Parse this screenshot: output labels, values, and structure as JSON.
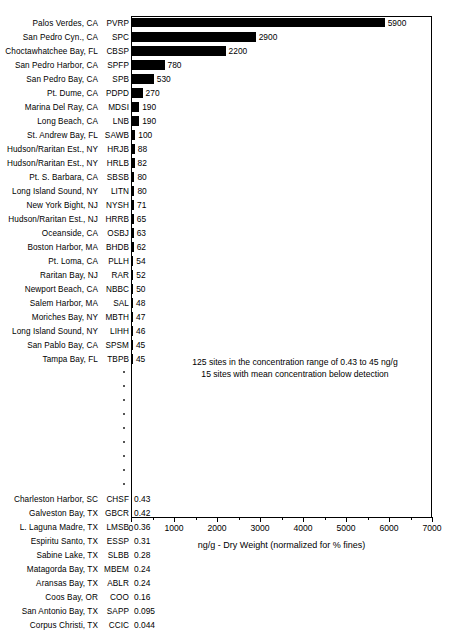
{
  "chart_data": {
    "type": "bar",
    "orientation": "horizontal",
    "title": "",
    "xlabel": "ng/g - Dry Weight (normalized for % fines)",
    "ylabel": "",
    "xlim": [
      0,
      7000
    ],
    "xticks": [
      0,
      1000,
      2000,
      3000,
      4000,
      5000,
      6000,
      7000
    ],
    "xtick_labels": [
      "0",
      "1000",
      "2000",
      "3000",
      "4000",
      "5000",
      "6000",
      "7000"
    ],
    "minor_tick_interval": 500,
    "grid": false,
    "legend": "none",
    "bar_color": "#000000",
    "categories": [
      "Palos Verdes, CA",
      "San Pedro Cyn., CA",
      "Choctawhatchee Bay, FL",
      "San Pedro Harbor, CA",
      "San Pedro Bay, CA",
      "Pt. Dume, CA",
      "Marina Del Ray, CA",
      "Long Beach, CA",
      "St. Andrew Bay, FL",
      "Hudson/Raritan Est., NY",
      "Hudson/Raritan Est., NY",
      "Pt. S. Barbara, CA",
      "Long Island Sound, NY",
      "New York Bight, NJ",
      "Hudson/Raritan Est., NJ",
      "Oceanside, CA",
      "Boston Harbor, MA",
      "Pt. Loma, CA",
      "Raritan Bay, NJ",
      "Newport Beach, CA",
      "Salem Harbor, MA",
      "Moriches Bay, NY",
      "Long Island Sound, NY",
      "San Pablo Bay, CA",
      "Tampa Bay, FL",
      "Charleston Harbor, SC",
      "Galveston Bay, TX",
      "L. Laguna Madre, TX",
      "Espiritu Santo, TX",
      "Sabine Lake, TX",
      "Matagorda Bay, TX",
      "Aransas Bay, TX",
      "Coos Bay, OR",
      "San Antonio Bay, TX",
      "Corpus Christi, TX"
    ],
    "codes": [
      "PVRP",
      "SPC",
      "CBSP",
      "SPFP",
      "SPB",
      "PDPD",
      "MDSI",
      "LNB",
      "SAWB",
      "HRJB",
      "HRLB",
      "SBSB",
      "LITN",
      "NYSH",
      "HRRB",
      "OSBJ",
      "BHDB",
      "PLLH",
      "RAR",
      "NBBC",
      "SAL",
      "MBTH",
      "LIHH",
      "SPSM",
      "TBPB",
      "CHSF",
      "GBCR",
      "LMSB",
      "ESSP",
      "SLBB",
      "MBEM",
      "ABLR",
      "COO",
      "SAPP",
      "CCIC"
    ],
    "values": [
      5900,
      2900,
      2200,
      780,
      530,
      270,
      190,
      190,
      100,
      88,
      82,
      80,
      80,
      71,
      65,
      63,
      62,
      54,
      52,
      50,
      48,
      47,
      46,
      45,
      45,
      0.43,
      0.42,
      0.36,
      0.31,
      0.28,
      0.24,
      0.24,
      0.16,
      0.095,
      0.044
    ],
    "value_labels": [
      "5900",
      "2900",
      "2200",
      "780",
      "530",
      "270",
      "190",
      "190",
      "100",
      "88",
      "82",
      "80",
      "80",
      "71",
      "65",
      "63",
      "62",
      "54",
      "52",
      "50",
      "48",
      "47",
      "46",
      "45",
      "45",
      "0.43",
      "0.42",
      "0.36",
      "0.31",
      "0.28",
      "0.24",
      "0.24",
      "0.16",
      "0.095",
      "0.044"
    ],
    "gap_after_index": 24,
    "gap_rows": 9,
    "annotation_lines": [
      "125 sites in the concentration range of 0.43 to 45 ng/g",
      "15 sites with mean concentration below detection"
    ]
  }
}
